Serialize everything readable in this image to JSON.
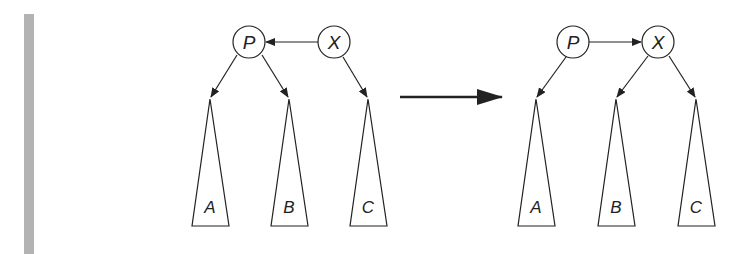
{
  "figure": {
    "before": {
      "nodes": [
        {
          "id": "P",
          "label": "P",
          "cx": 249,
          "cy": 42
        },
        {
          "id": "X",
          "label": "X",
          "cx": 334,
          "cy": 42
        }
      ],
      "edges": [
        {
          "from": "X",
          "to": "P"
        },
        {
          "from": "P",
          "to": "A"
        },
        {
          "from": "P",
          "to": "B"
        },
        {
          "from": "X",
          "to": "C"
        }
      ],
      "subtrees": [
        {
          "label": "A",
          "apex_x": 210
        },
        {
          "label": "B",
          "apex_x": 289
        },
        {
          "label": "C",
          "apex_x": 368
        }
      ]
    },
    "transition_arrow": {
      "from_x": 400,
      "to_x": 502,
      "y": 97
    },
    "after": {
      "nodes": [
        {
          "id": "P",
          "label": "P",
          "cx": 573,
          "cy": 42
        },
        {
          "id": "X",
          "label": "X",
          "cx": 658,
          "cy": 42
        }
      ],
      "edges": [
        {
          "from": "P",
          "to": "X"
        },
        {
          "from": "P",
          "to": "A"
        },
        {
          "from": "X",
          "to": "B"
        },
        {
          "from": "X",
          "to": "C"
        }
      ],
      "subtrees": [
        {
          "label": "A",
          "apex_x": 536
        },
        {
          "label": "B",
          "apex_x": 616
        },
        {
          "label": "C",
          "apex_x": 696
        }
      ]
    },
    "colors": {
      "stroke": "#222222",
      "sidebar": "#b3b3b3"
    }
  }
}
